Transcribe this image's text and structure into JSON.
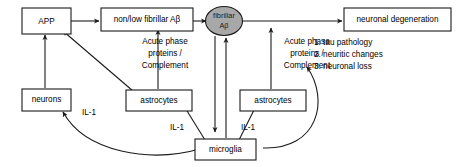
{
  "diagram": {
    "background_color": "#ffffff",
    "stroke_color": "#1a1a1a",
    "oval_fill_color": "#a8a8a8",
    "nodes": {
      "app": {
        "label": "APP",
        "shape": "box"
      },
      "non_low_fibrillar": {
        "label": "non/low fibrillar Aβ",
        "shape": "box"
      },
      "fibrillar_line1": {
        "label": "fibrillar",
        "shape": "oval"
      },
      "fibrillar_line2": {
        "label": "Aβ",
        "shape": "oval"
      },
      "neuronal_degeneration": {
        "label": "neuronal degeneration",
        "shape": "box"
      },
      "neurons": {
        "label": "neurons",
        "shape": "box"
      },
      "astrocytes_left": {
        "label": "astrocytes",
        "shape": "box"
      },
      "astrocytes_right": {
        "label": "astrocytes",
        "shape": "box"
      },
      "microglia": {
        "label": "microglia",
        "shape": "box"
      }
    },
    "edge_labels": {
      "acute_left_line1": "Acute phase",
      "acute_left_line2": "proteins /",
      "acute_left_line3": "Complement",
      "acute_right_line1": "Acute phase",
      "acute_right_line2": "proteins /",
      "acute_right_line3": "Complement",
      "il1_neurons": "IL-1",
      "il1_astrocytes_left": "IL-1",
      "il1_astrocytes_right": "IL-1"
    },
    "outcome_list": [
      "1. tau pathology",
      "2. neuritic changes",
      "3. neuronal loss"
    ]
  }
}
